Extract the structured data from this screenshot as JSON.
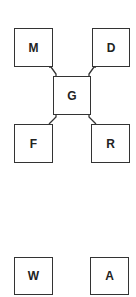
{
  "diagram": {
    "nodes": [
      {
        "id": "M",
        "label": "M",
        "x": 14,
        "y": 28,
        "w": 39,
        "h": 39
      },
      {
        "id": "D",
        "label": "D",
        "x": 92,
        "y": 28,
        "w": 38,
        "h": 39
      },
      {
        "id": "G",
        "label": "G",
        "x": 53,
        "y": 76,
        "w": 38,
        "h": 39
      },
      {
        "id": "F",
        "label": "F",
        "x": 14,
        "y": 124,
        "w": 39,
        "h": 39
      },
      {
        "id": "R",
        "label": "R",
        "x": 91,
        "y": 124,
        "w": 39,
        "h": 39
      },
      {
        "id": "W",
        "label": "W",
        "x": 14,
        "y": 257,
        "w": 39,
        "h": 38
      },
      {
        "id": "A",
        "label": "A",
        "x": 90,
        "y": 257,
        "w": 39,
        "h": 38
      }
    ],
    "edges": [
      {
        "from": "M",
        "to": "G"
      },
      {
        "from": "D",
        "to": "G"
      },
      {
        "from": "G",
        "to": "F"
      },
      {
        "from": "G",
        "to": "R"
      }
    ],
    "colors": {
      "stroke": "#333333",
      "background": "#ffffff",
      "text": "#222222"
    }
  }
}
